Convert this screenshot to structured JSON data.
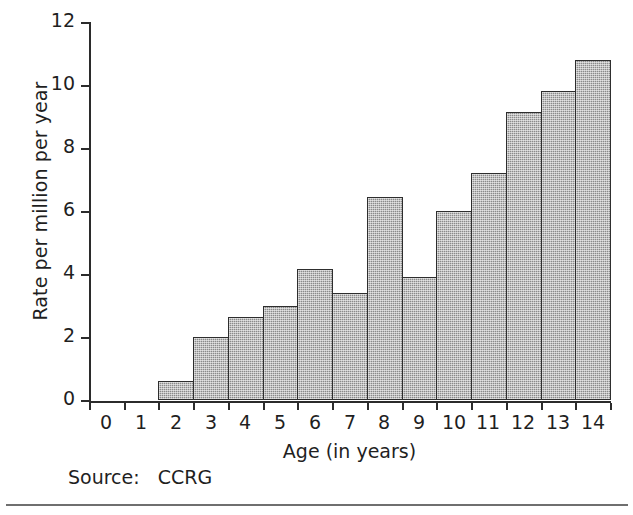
{
  "chart_data": {
    "type": "bar",
    "title": "",
    "xlabel": "Age (in years)",
    "ylabel": "Rate per million per year",
    "categories": [
      "0",
      "1",
      "2",
      "3",
      "4",
      "5",
      "6",
      "7",
      "8",
      "9",
      "10",
      "11",
      "12",
      "13",
      "14"
    ],
    "values": [
      0,
      0,
      0.6,
      2.0,
      2.65,
      3.0,
      4.15,
      3.4,
      6.45,
      3.9,
      6.0,
      7.2,
      9.15,
      9.8,
      10.8
    ],
    "ylim": [
      0,
      12
    ],
    "xlim": [
      0,
      15
    ],
    "y_ticks": [
      "0",
      "2",
      "4",
      "6",
      "8",
      "10",
      "12"
    ],
    "y_tick_values": [
      0,
      2,
      4,
      6,
      8,
      10,
      12
    ],
    "grid": false,
    "legend": null,
    "bar_fill_color": "#8b8b8b",
    "bar_edge_color": "#2e2e2e",
    "axis_color": "#2b2b2b",
    "background_color": "#ffffff"
  },
  "annotations": {
    "source_label": "Source:",
    "source_value": "CCRG",
    "source_line": "Source:   CCRG"
  }
}
